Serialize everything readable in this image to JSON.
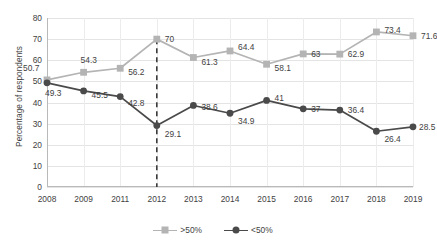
{
  "chart_data": {
    "type": "line",
    "title": "",
    "xlabel": "",
    "ylabel": "Percentage of respondents",
    "ylim": [
      0,
      80
    ],
    "ytick_step": 10,
    "yticks": [
      "0",
      "10",
      "20",
      "30",
      "40",
      "50",
      "60",
      "70",
      "80"
    ],
    "grid": true,
    "legend_position": "bottom",
    "categories": [
      "2008",
      "2009",
      "2011",
      "2012",
      "2013",
      "2014",
      "2015",
      "2016",
      "2017",
      "2018",
      "2019"
    ],
    "series": [
      {
        "name": ">50%",
        "color": "#b4b4b4",
        "marker": "square",
        "values": [
          50.7,
          54.3,
          56.2,
          70,
          61.3,
          64.4,
          58.1,
          63,
          62.9,
          73.4,
          71.6
        ],
        "labels": [
          "50.7",
          "54.3",
          "56.2",
          "70",
          "61.3",
          "64.4",
          "58.1",
          "63",
          "62.9",
          "73.4",
          "71.6"
        ]
      },
      {
        "name": "<50%",
        "color": "#4a4a4a",
        "marker": "circle",
        "values": [
          49.3,
          45.5,
          42.8,
          29.1,
          38.6,
          34.9,
          41,
          37,
          36.4,
          26.4,
          28.5
        ],
        "labels": [
          "49.3",
          "45.5",
          "42.8",
          "29.1",
          "38.6",
          "34.9",
          "41",
          "37",
          "36.4",
          "26.4",
          "28.5"
        ]
      }
    ],
    "annotations": [
      {
        "type": "vertical-dashed-line",
        "at_category": "2012",
        "color": "#3b3b3b",
        "y_from": 0,
        "y_to": 70
      }
    ]
  },
  "legend": {
    "items": [
      {
        "label": ">50%",
        "color": "#b4b4b4",
        "marker": "square"
      },
      {
        "label": "<50%",
        "color": "#4a4a4a",
        "marker": "circle"
      }
    ]
  }
}
